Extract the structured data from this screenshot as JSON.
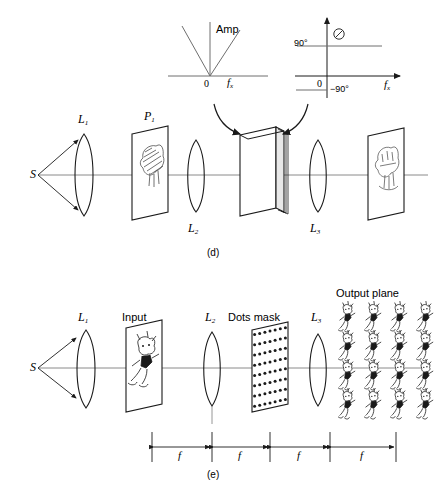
{
  "figure": {
    "captions": {
      "d": "(d)",
      "e": "(e)"
    }
  },
  "chart_data": [
    {
      "type": "line",
      "title": "Amp",
      "xlabel": "f_x",
      "ylabel": "Amp",
      "origin_label": "0",
      "grid": false,
      "legend": null,
      "x": [
        -1,
        0,
        1
      ],
      "values": [
        1,
        0,
        1
      ],
      "description": "V-shaped amplitude transfer |f_x| rising linearly on both sides of zero",
      "tick_labels": [
        "0"
      ],
      "axis_labels": {
        "x": "f_x",
        "y": "Amp"
      }
    },
    {
      "type": "line",
      "title": "Ø",
      "xlabel": "f_x",
      "ylabel": "Ø",
      "origin_label": "0",
      "grid": false,
      "legend": null,
      "x": [
        -1,
        0,
        0,
        1
      ],
      "values": [
        90,
        90,
        -90,
        -90
      ],
      "description": "Phase step function: +90 degrees for negative f_x, -90 degrees for positive f_x",
      "tick_labels": [
        "90°",
        "0",
        "−90°"
      ],
      "axis_labels": {
        "x": "f_x",
        "y": "Ø"
      }
    }
  ],
  "panel_d": {
    "caption": "(d)",
    "source_label": "S",
    "lens1_label": "L",
    "lens1_sub": "1",
    "plane1_label": "P",
    "plane1_sub": "1",
    "lens2_label": "L",
    "lens2_sub": "2",
    "lens3_label": "L",
    "lens3_sub": "3",
    "filter_name": "fourier-plane-filter",
    "input_object": "hatched-blob-object",
    "output_object": "filtered-blob-image"
  },
  "panel_e": {
    "caption": "(e)",
    "source_label": "S",
    "lens1_label": "L",
    "lens1_sub": "1",
    "input_label": "Input",
    "lens2_label": "L",
    "lens2_sub": "2",
    "mask_label": "Dots mask",
    "lens3_label": "L",
    "lens3_sub": "3",
    "output_label": "Output plane",
    "distances": [
      "f",
      "f",
      "f",
      "f"
    ],
    "output_grid": {
      "rows": 4,
      "cols": 4
    },
    "dots_grid": {
      "rows": 8,
      "cols": 7
    }
  },
  "colors": {
    "ink": "#1a1a1a",
    "axis": "#6e6e6e",
    "background": "#ffffff"
  }
}
